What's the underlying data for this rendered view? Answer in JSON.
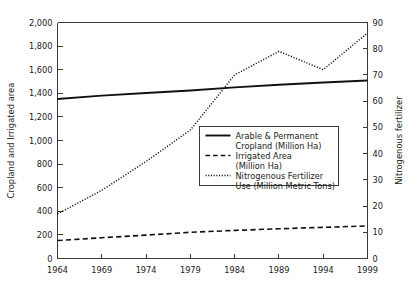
{
  "chart_data": {
    "type": "line",
    "title": "",
    "xlabel": "",
    "ylabel": "Cropland and Irrigated area",
    "y2label": "Nitrogenous fertilizer",
    "x": [
      1964,
      1969,
      1974,
      1979,
      1984,
      1989,
      1994,
      1999
    ],
    "xlim": [
      1964,
      1999
    ],
    "ylim": [
      0,
      2000
    ],
    "y2lim": [
      0,
      90
    ],
    "xticks": [
      "1964",
      "1969",
      "1974",
      "1979",
      "1984",
      "1989",
      "1994",
      "1999"
    ],
    "yticks": [
      "0",
      "200",
      "400",
      "600",
      "800",
      "1,000",
      "1,200",
      "1,400",
      "1,600",
      "1,800",
      "2,000"
    ],
    "y2ticks": [
      "0",
      "10",
      "20",
      "30",
      "40",
      "50",
      "60",
      "70",
      "80",
      "90"
    ],
    "grid": false,
    "legend_position": "center-right-inside",
    "series": [
      {
        "name": "Arable & Permanent Cropland (Million Ha)",
        "legend_line1": "Arable & Permanent",
        "legend_line2": "Cropland (Million Ha)",
        "style": "solid",
        "axis": "left",
        "values": [
          1352,
          1380,
          1402,
          1424,
          1450,
          1472,
          1492,
          1508
        ]
      },
      {
        "name": "Irrigated Area (Million Ha)",
        "legend_line1": "Irrigated Area",
        "legend_line2": "(Million Ha)",
        "style": "dashed",
        "axis": "left",
        "values": [
          152,
          176,
          198,
          222,
          238,
          252,
          264,
          276
        ]
      },
      {
        "name": "Nitrogenous Fertilizer Use (Million Metric Tons)",
        "legend_line1": "Nitrogenous Fertilizer",
        "legend_line2": "Use (Million Metric Tons)",
        "style": "dotted",
        "axis": "right",
        "values": [
          17,
          26,
          37,
          49,
          70,
          79,
          72,
          86
        ]
      }
    ]
  },
  "colors": {
    "line": "#111111",
    "axis": "#3a3a3a",
    "background": "#ffffff"
  }
}
